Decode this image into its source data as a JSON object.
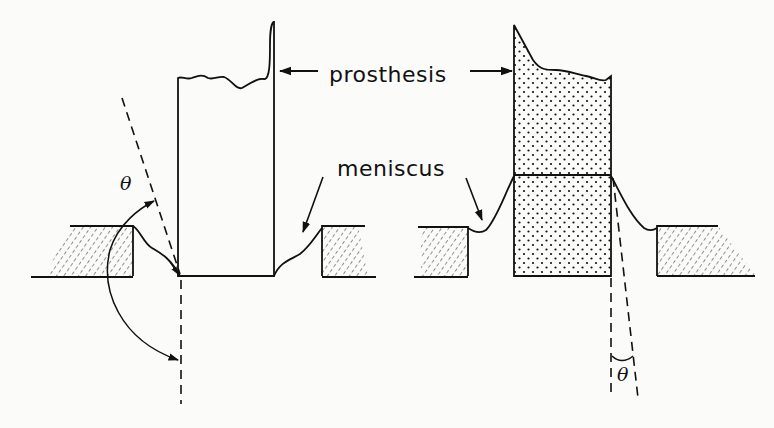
{
  "figure": {
    "colors": {
      "ink": "#111111",
      "background": "#fbfbfa"
    }
  },
  "labels": {
    "prosthesis": "prosthesis",
    "meniscus": "meniscus",
    "theta_left": "θ",
    "theta_right": "θ"
  },
  "panels": [
    {
      "id": "left",
      "prosthesis_fill": "none",
      "angle_label": "θ",
      "meniscus_shape": "concave-down near wall"
    },
    {
      "id": "right",
      "prosthesis_fill": "dotted",
      "angle_label": "θ",
      "meniscus_shape": "raised along wall"
    }
  ]
}
